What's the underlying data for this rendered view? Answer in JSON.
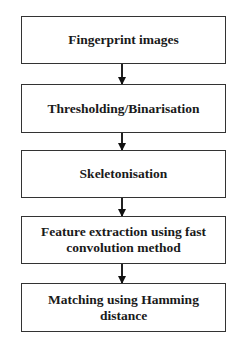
{
  "flowchart": {
    "steps": [
      {
        "label": "Fingerprint images"
      },
      {
        "label": "Thresholding/Binarisation"
      },
      {
        "label": "Skeletonisation"
      },
      {
        "label": "Feature extraction using fast convolution method"
      },
      {
        "label": "Matching using Hamming distance"
      }
    ],
    "colors": {
      "border": "#333333",
      "arrow": "#222222",
      "text": "#1a1a1a",
      "background": "#ffffff"
    }
  }
}
